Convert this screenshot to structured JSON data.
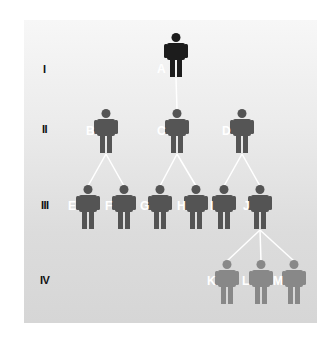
{
  "diagram": {
    "type": "pedigree",
    "colors": {
      "generation_1": "#1c1c1c",
      "generation_2": "#555555",
      "generation_3": "#555555",
      "generation_4": "#888888",
      "connector": "#ffffff",
      "label": "#ffffff"
    },
    "generations": [
      {
        "label": "I",
        "members": [
          "A"
        ]
      },
      {
        "label": "II",
        "members": [
          "B",
          "C",
          "D"
        ]
      },
      {
        "label": "III",
        "members": [
          "E",
          "F",
          "G",
          "H",
          "I",
          "J"
        ]
      },
      {
        "label": "IV",
        "members": [
          "K",
          "L",
          "M"
        ]
      }
    ],
    "relationships": [
      {
        "parent": "A",
        "children": [
          "C"
        ]
      },
      {
        "parent": "B",
        "children": [
          "E",
          "F"
        ]
      },
      {
        "parent": "C",
        "children": [
          "G",
          "H"
        ]
      },
      {
        "parent": "D",
        "children": [
          "I",
          "J"
        ]
      },
      {
        "parent": "J",
        "children": [
          "K",
          "L",
          "M"
        ]
      }
    ]
  },
  "labels": {
    "gen_I": "I",
    "gen_II": "II",
    "gen_III": "III",
    "gen_IV": "IV",
    "A": "A",
    "B": "B",
    "C": "C",
    "D": "D",
    "E": "E",
    "F": "F",
    "G": "G",
    "H": "H",
    "I": "I",
    "J": "J",
    "K": "K",
    "L": "L",
    "M": "M"
  }
}
